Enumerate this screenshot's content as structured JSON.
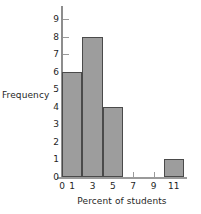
{
  "chart_data": {
    "type": "bar",
    "title": "",
    "xlabel": "Percent of students",
    "ylabel": "Frequency",
    "xlim": [
      0,
      12
    ],
    "ylim": [
      0,
      9
    ],
    "grid": false,
    "legend": null,
    "bin_width": 2,
    "categories": [
      "0-2",
      "2-4",
      "4-6",
      "6-8",
      "8-10",
      "10-12"
    ],
    "bin_edges": [
      0,
      2,
      4,
      6,
      8,
      10,
      12
    ],
    "values": [
      6,
      8,
      4,
      0,
      0,
      1
    ],
    "bars": [
      {
        "label": "0-2",
        "x0": 0,
        "x1": 2,
        "value": 6
      },
      {
        "label": "2-4",
        "x0": 2,
        "x1": 4,
        "value": 8
      },
      {
        "label": "4-6",
        "x0": 4,
        "x1": 6,
        "value": 4
      },
      {
        "label": "10-12",
        "x0": 10,
        "x1": 12,
        "value": 1
      }
    ],
    "y_ticks": [
      0,
      1,
      2,
      3,
      4,
      5,
      6,
      7,
      8,
      9
    ],
    "x_ticks": [
      0,
      1,
      3,
      5,
      7,
      9,
      11
    ],
    "colors": {
      "bar_fill": "#9d9d9d",
      "bar_stroke": "#4a4a4a",
      "axis": "#9a9a9a",
      "text": "#1f1f1f",
      "background": "#ffffff"
    }
  }
}
